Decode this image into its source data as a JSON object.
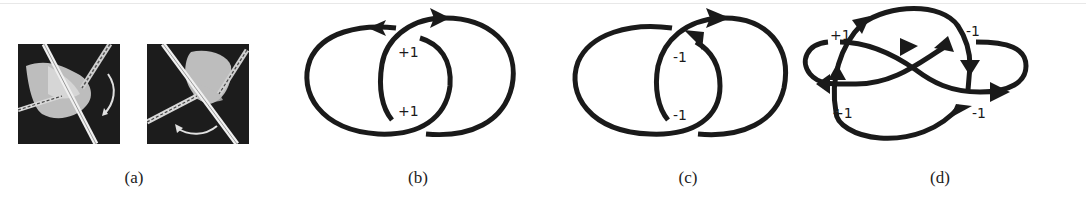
{
  "figure": {
    "panels": [
      {
        "id": "a",
        "caption": "(a)",
        "content": "Two grayscale photographs of a surgical/robotic tool grasping and rotating tissue, curved arrows indicate rotation direction",
        "photos": [
          {
            "rotation_arrow": "clockwise-right"
          },
          {
            "rotation_arrow": "counterclockwise-bottom"
          }
        ]
      },
      {
        "id": "b",
        "caption": "(b)",
        "content": "Two linked oriented loops (Hopf link), positive crossings",
        "crossing_labels": [
          "+1",
          "+1"
        ]
      },
      {
        "id": "c",
        "caption": "(c)",
        "content": "Two linked oriented loops (Hopf link), negative crossings",
        "crossing_labels": [
          "-1",
          "-1"
        ]
      },
      {
        "id": "d",
        "caption": "(d)",
        "content": "Oriented link diagram with four crossings",
        "crossing_labels": [
          "+1",
          "-1",
          "+1",
          "-1"
        ]
      }
    ],
    "colors": {
      "stroke": "#1a1a1a",
      "photo_bg": "#1c1c1c",
      "photo_tissue": "#cfcfcf",
      "background": "#ffffff"
    }
  }
}
